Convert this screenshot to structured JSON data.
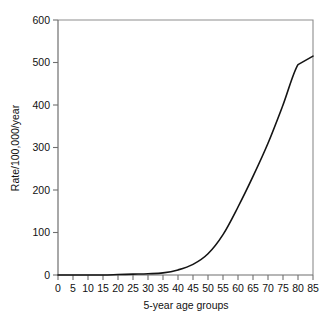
{
  "chart_data": {
    "type": "line",
    "title": "",
    "subtitle": "",
    "xlabel": "5-year age groups",
    "ylabel": "Rate/100,000/year",
    "xlim": [
      0,
      85
    ],
    "ylim": [
      0,
      600
    ],
    "grid": false,
    "legend": "none",
    "x_ticks": [
      0,
      5,
      10,
      15,
      20,
      25,
      30,
      35,
      40,
      45,
      50,
      55,
      60,
      65,
      70,
      75,
      80,
      85
    ],
    "x_tick_labels": [
      "0",
      "5",
      "10",
      "15",
      "20",
      "25",
      "30",
      "35",
      "40",
      "45",
      "50",
      "55",
      "60",
      "65",
      "70",
      "75",
      "80",
      "85"
    ],
    "y_ticks": [
      0,
      100,
      200,
      300,
      400,
      500,
      600
    ],
    "y_tick_labels": [
      "0",
      "100",
      "200",
      "300",
      "400",
      "500",
      "600"
    ],
    "x": [
      0,
      5,
      10,
      15,
      20,
      25,
      30,
      35,
      40,
      45,
      50,
      55,
      60,
      65,
      70,
      75,
      80,
      85
    ],
    "values": [
      0,
      0,
      0,
      0,
      1,
      2,
      3,
      5,
      12,
      25,
      50,
      95,
      160,
      232,
      310,
      400,
      495,
      515
    ],
    "series": [
      {
        "name": "Rate",
        "color": "#141414",
        "values": [
          0,
          0,
          0,
          0,
          1,
          2,
          3,
          5,
          12,
          25,
          50,
          95,
          160,
          232,
          310,
          400,
          495,
          515
        ]
      }
    ],
    "annotations": []
  },
  "figure": {
    "background_color": "#ffffff",
    "frame_color": "#8d8d8d",
    "line_color": "#141414"
  }
}
